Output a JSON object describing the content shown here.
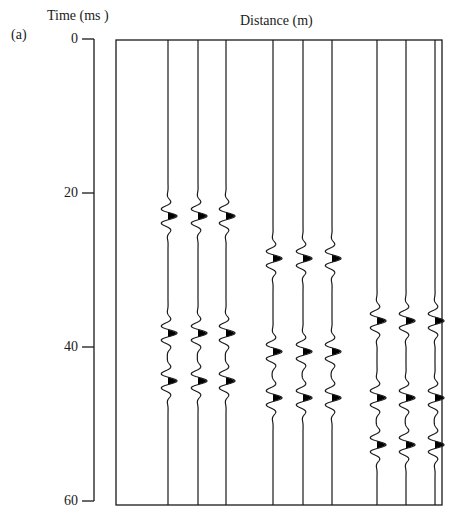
{
  "figure": {
    "panel_label": "(a)",
    "y_axis_title": "Time (ms )",
    "x_axis_title": "Distance (m)",
    "y_ticks": [
      {
        "label": "0",
        "value": 0
      },
      {
        "label": "20",
        "value": 20
      },
      {
        "label": "40",
        "value": 40
      },
      {
        "label": "60",
        "value": 60
      }
    ],
    "line_color": "#1a1a1a",
    "fill_color": "#000000"
  },
  "chart_data": {
    "type": "seismic-wiggle",
    "title": "",
    "xlabel": "Distance (m)",
    "ylabel": "Time (ms )",
    "ylim": [
      0,
      60
    ],
    "y_inverted": true,
    "traces": [
      {
        "group": 1,
        "arrivals_ms": [
          23.0,
          38.2,
          44.4
        ]
      },
      {
        "group": 1,
        "arrivals_ms": [
          23.0,
          38.2,
          44.4
        ]
      },
      {
        "group": 1,
        "arrivals_ms": [
          23.0,
          38.2,
          44.4
        ]
      },
      {
        "group": 2,
        "arrivals_ms": [
          28.5,
          40.6,
          46.6
        ]
      },
      {
        "group": 2,
        "arrivals_ms": [
          28.5,
          40.6,
          46.6
        ]
      },
      {
        "group": 2,
        "arrivals_ms": [
          28.5,
          40.6,
          46.6
        ]
      },
      {
        "group": 3,
        "arrivals_ms": [
          36.6,
          46.6,
          52.7
        ]
      },
      {
        "group": 3,
        "arrivals_ms": [
          36.6,
          46.6,
          52.7
        ]
      },
      {
        "group": 3,
        "arrivals_ms": [
          36.6,
          46.6,
          52.7
        ]
      }
    ],
    "trace_x_px": [
      168,
      198,
      226,
      273,
      303,
      332,
      377,
      406,
      435
    ]
  }
}
